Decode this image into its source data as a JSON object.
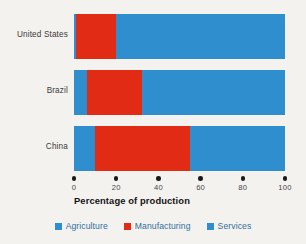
{
  "chart_data": {
    "type": "bar",
    "orientation": "horizontal",
    "stacked": true,
    "title": "",
    "subtitle": "",
    "xlabel": "Percentage of production",
    "ylabel": "",
    "xlim": [
      0,
      100
    ],
    "xticks": [
      0,
      20,
      40,
      60,
      80,
      100
    ],
    "xtick_labels": [
      "0",
      "20",
      "40",
      "60",
      "80",
      "100"
    ],
    "grid": false,
    "legend_position": "bottom",
    "categories": [
      "United States",
      "Brazil",
      "China"
    ],
    "series": [
      {
        "name": "Agriculture",
        "color": "#2f8fce",
        "values": [
          1,
          6,
          10
        ]
      },
      {
        "name": "Manufacturing",
        "color": "#e22b14",
        "values": [
          19,
          26,
          45
        ]
      },
      {
        "name": "Services",
        "color": "#2f8fce",
        "values": [
          80,
          68,
          45
        ]
      }
    ],
    "annotations": []
  },
  "axis": {
    "title": "Percentage of production",
    "ticks": [
      {
        "label": "0",
        "value": 0
      },
      {
        "label": "20",
        "value": 20
      },
      {
        "label": "40",
        "value": 40
      },
      {
        "label": "60",
        "value": 60
      },
      {
        "label": "80",
        "value": 80
      },
      {
        "label": "100",
        "value": 100
      }
    ]
  },
  "categories": [
    {
      "label": "United States"
    },
    {
      "label": "Brazil"
    },
    {
      "label": "China"
    }
  ],
  "legend": {
    "items": [
      {
        "label": "Agriculture",
        "color": "#2f8fce"
      },
      {
        "label": "Manufacturing",
        "color": "#e22b14"
      },
      {
        "label": "Services",
        "color": "#2f8fce"
      }
    ]
  },
  "colors": {
    "background": "#f4f2ee",
    "blue": "#2f8fce",
    "red": "#e22b14",
    "tick": "#1a1a1a",
    "axis_title": "#131315",
    "legend_text": "#2f6f9e",
    "category_text": "#3b3b40"
  }
}
